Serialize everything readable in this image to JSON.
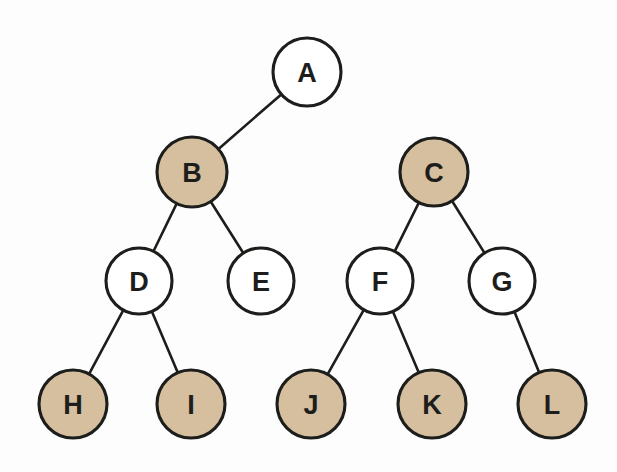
{
  "diagram": {
    "type": "binary-tree",
    "canvas": {
      "width": 617,
      "height": 472,
      "background": "#fdfdfd"
    },
    "colors": {
      "node_fill_shaded": "#d6bf9e",
      "node_fill_plain": "#ffffff",
      "node_stroke": "#1d1d1b",
      "edge_stroke": "#1d1d1b",
      "label_color": "#1d1d1b"
    },
    "levels": [
      {
        "index": 0,
        "y": 72,
        "nodes": [
          "A"
        ]
      },
      {
        "index": 1,
        "y": 172,
        "nodes": [
          "B",
          "C"
        ]
      },
      {
        "index": 2,
        "y": 281,
        "nodes": [
          "D",
          "E",
          "F",
          "G"
        ]
      },
      {
        "index": 3,
        "y": 404,
        "nodes": [
          "H",
          "I",
          "J",
          "K",
          "L"
        ]
      }
    ],
    "nodes": [
      {
        "id": "A",
        "label": "A",
        "cx": 307,
        "cy": 72,
        "r": 34,
        "shaded": false,
        "level": 0
      },
      {
        "id": "B",
        "label": "B",
        "cx": 192,
        "cy": 172,
        "r": 35,
        "shaded": true,
        "level": 1
      },
      {
        "id": "C",
        "label": "C",
        "cx": 434,
        "cy": 172,
        "r": 34,
        "shaded": true,
        "level": 1
      },
      {
        "id": "D",
        "label": "D",
        "cx": 139,
        "cy": 281,
        "r": 33,
        "shaded": false,
        "level": 2
      },
      {
        "id": "E",
        "label": "E",
        "cx": 261,
        "cy": 281,
        "r": 33,
        "shaded": false,
        "level": 2
      },
      {
        "id": "F",
        "label": "F",
        "cx": 380,
        "cy": 281,
        "r": 33,
        "shaded": false,
        "level": 2
      },
      {
        "id": "G",
        "label": "G",
        "cx": 502,
        "cy": 281,
        "r": 33,
        "shaded": false,
        "level": 2
      },
      {
        "id": "H",
        "label": "H",
        "cx": 73,
        "cy": 404,
        "r": 34,
        "shaded": true,
        "level": 3
      },
      {
        "id": "I",
        "label": "I",
        "cx": 191,
        "cy": 404,
        "r": 34,
        "shaded": true,
        "level": 3
      },
      {
        "id": "J",
        "label": "J",
        "cx": 311,
        "cy": 404,
        "r": 34,
        "shaded": true,
        "level": 3
      },
      {
        "id": "K",
        "label": "K",
        "cx": 432,
        "cy": 404,
        "r": 34,
        "shaded": true,
        "level": 3
      },
      {
        "id": "L",
        "label": "L",
        "cx": 552,
        "cy": 404,
        "r": 34,
        "shaded": true,
        "level": 3
      }
    ],
    "edges": [
      {
        "from": "A",
        "to": "B"
      },
      {
        "from": "B",
        "to": "D"
      },
      {
        "from": "B",
        "to": "E"
      },
      {
        "from": "C",
        "to": "F"
      },
      {
        "from": "C",
        "to": "G"
      },
      {
        "from": "D",
        "to": "H"
      },
      {
        "from": "D",
        "to": "I"
      },
      {
        "from": "F",
        "to": "J"
      },
      {
        "from": "F",
        "to": "K"
      },
      {
        "from": "G",
        "to": "L"
      }
    ]
  }
}
